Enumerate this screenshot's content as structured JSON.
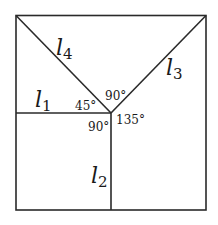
{
  "diagram": {
    "frame": {
      "x1": 16,
      "y1": 15,
      "x2": 206,
      "y2": 210
    },
    "vertex": {
      "x": 111,
      "y": 113
    },
    "lines": [
      {
        "id": "l1",
        "name": "l",
        "sub": "1",
        "from": [
          16,
          113
        ],
        "to": [
          111,
          113
        ],
        "label_pos": [
          35,
          107
        ]
      },
      {
        "id": "l2",
        "name": "l",
        "sub": "2",
        "from": [
          111,
          113
        ],
        "to": [
          111,
          210
        ],
        "label_pos": [
          91,
          183
        ]
      },
      {
        "id": "l3",
        "name": "l",
        "sub": "3",
        "from": [
          111,
          113
        ],
        "to": [
          206,
          16
        ],
        "label_pos": [
          166,
          75
        ]
      },
      {
        "id": "l4",
        "name": "l",
        "sub": "4",
        "from": [
          16,
          15
        ],
        "to": [
          111,
          113
        ],
        "label_pos": [
          56,
          55
        ]
      }
    ],
    "angles": [
      {
        "id": "angle-l1-l4",
        "text": "45°",
        "pos": [
          75,
          110
        ]
      },
      {
        "id": "angle-l4-l3",
        "text": "90°",
        "pos": [
          105,
          100
        ]
      },
      {
        "id": "angle-l3-l2",
        "text": "135°",
        "pos": [
          116,
          124
        ]
      },
      {
        "id": "angle-l1-l2",
        "text": "90°",
        "pos": [
          88,
          131
        ]
      }
    ],
    "stroke_color": "#2a2a2a",
    "text_color": "#1a1a1a"
  }
}
